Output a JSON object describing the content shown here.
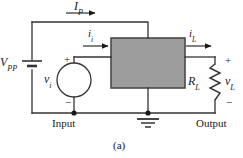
{
  "figure": {
    "caption": "(a)",
    "box_fill": "#9d9d9d",
    "box_stroke": "#4a4a4a",
    "wire_color": "#333333"
  },
  "labels": {
    "supply_current": {
      "base": "I",
      "sub": "P"
    },
    "input_current": {
      "base": "i",
      "sub": "i"
    },
    "load_current": {
      "base": "i",
      "sub": "L"
    },
    "supply_voltage": {
      "base": "V",
      "sub": "PP"
    },
    "input_voltage": {
      "base": "v",
      "sub": "i"
    },
    "load_voltage": {
      "base": "v",
      "sub": "L"
    },
    "load_resistor": {
      "base": "R",
      "sub": "L"
    },
    "input_terminal": "Input",
    "output_terminal": "Output"
  },
  "polarity": {
    "input_plus": "+",
    "input_minus": "−",
    "output_plus": "+",
    "output_minus": "−"
  },
  "components": {
    "battery": "dc-voltage-source",
    "source": "ac-voltage-source",
    "resistor": "resistor-zigzag",
    "ground": "earth-ground",
    "amplifier": "amplifier-block"
  }
}
